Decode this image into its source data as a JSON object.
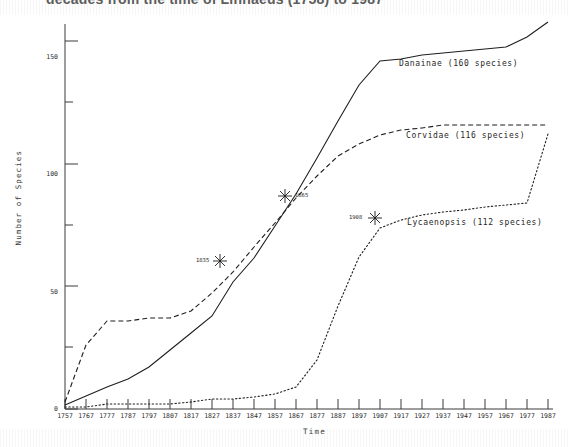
{
  "title": {
    "text": "decades from the time of Linnaeus (1758) to 1987",
    "note": "cropped-top-caption"
  },
  "axes": {
    "ylabel": "Number of Species",
    "xlabel": "Time",
    "y_ticks_major": [
      "0",
      "50",
      "100",
      "150"
    ],
    "y_ticks_minor": [
      "25",
      "75",
      "125"
    ],
    "x_ticks": [
      "1757",
      "1767",
      "1777",
      "1787",
      "1797",
      "1807",
      "1817",
      "1827",
      "1837",
      "1847",
      "1857",
      "1867",
      "1877",
      "1887",
      "1897",
      "1907",
      "1917",
      "1927",
      "1937",
      "1947",
      "1957",
      "1967",
      "1977",
      "1987"
    ]
  },
  "series_labels": {
    "danainae": "Danainae (160 species)",
    "corvidae": "Corvidae (116 species)",
    "lycaenopsis": "Lycaenopsis (112 species)"
  },
  "annotations": [
    {
      "label": "1835",
      "year": 1835,
      "value": 58
    },
    {
      "label": "1865",
      "year": 1865,
      "value": 85
    },
    {
      "label": "1908",
      "year": 1908,
      "value": 75
    }
  ],
  "colors": {
    "ink": "#1f1f1f",
    "axis": "#3a3a3a",
    "background": "#ffffff"
  },
  "chart_data": {
    "type": "line",
    "title": "decades from the time of Linnaeus (1758) to 1987",
    "xlabel": "Time",
    "ylabel": "Number of Species",
    "xlim": [
      1757,
      1987
    ],
    "ylim": [
      0,
      165
    ],
    "grid": false,
    "legend": "inline-labels-right",
    "series": [
      {
        "name": "Danainae (160 species)",
        "style": "solid",
        "total_species": 160,
        "x": [
          1757,
          1767,
          1777,
          1787,
          1797,
          1807,
          1817,
          1827,
          1837,
          1847,
          1857,
          1867,
          1877,
          1887,
          1897,
          1907,
          1917,
          1927,
          1937,
          1947,
          1957,
          1967,
          1977,
          1987
        ],
        "y": [
          2,
          6,
          9,
          13,
          18,
          24,
          31,
          38,
          52,
          62,
          75,
          88,
          103,
          118,
          133,
          143,
          144,
          146,
          147,
          148,
          149,
          150,
          154,
          160
        ]
      },
      {
        "name": "Corvidae (116 species)",
        "style": "dashed",
        "total_species": 116,
        "x": [
          1757,
          1767,
          1777,
          1787,
          1797,
          1807,
          1817,
          1827,
          1837,
          1847,
          1857,
          1867,
          1877,
          1887,
          1897,
          1907,
          1917,
          1927,
          1937,
          1947,
          1957,
          1967,
          1977,
          1987
        ],
        "y": [
          3,
          26,
          36,
          36,
          37,
          37,
          40,
          47,
          56,
          66,
          76,
          86,
          95,
          103,
          108,
          112,
          114,
          115,
          116,
          116,
          116,
          116,
          116,
          116
        ]
      },
      {
        "name": "Lycaenopsis (112 species)",
        "style": "dotted",
        "total_species": 112,
        "x": [
          1757,
          1767,
          1777,
          1787,
          1797,
          1807,
          1817,
          1827,
          1837,
          1847,
          1857,
          1867,
          1877,
          1887,
          1897,
          1907,
          1917,
          1927,
          1937,
          1947,
          1957,
          1967,
          1977,
          1987
        ],
        "y": [
          1,
          1,
          2,
          2,
          2,
          2,
          3,
          4,
          4,
          5,
          6,
          9,
          20,
          42,
          62,
          74,
          77,
          79,
          80,
          81,
          82,
          83,
          84,
          112
        ]
      }
    ],
    "annotated_points": [
      {
        "series": "Danainae (160 species)",
        "label": "1835",
        "x": 1835,
        "y": 58
      },
      {
        "series": "Danainae (160 species)",
        "label": "1865",
        "x": 1865,
        "y": 85
      },
      {
        "series": "Lycaenopsis (112 species)",
        "label": "1908",
        "x": 1908,
        "y": 75
      }
    ]
  }
}
